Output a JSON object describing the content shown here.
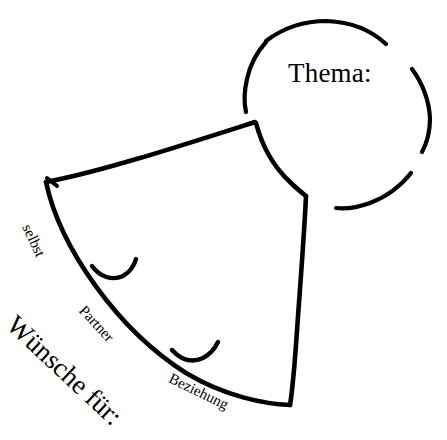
{
  "figure": {
    "kind": "hand-drawn-diagram",
    "title_visible": false,
    "background_color": "#ffffff",
    "ink_color": "#000000",
    "width": 447,
    "height": 440
  },
  "circle": {
    "name": "thema-circle",
    "label": "Thema:",
    "center": {
      "x": 337,
      "y": 109
    },
    "radius": 95,
    "style": "broken / sketched outline with four gaps",
    "arcs": [
      {
        "name": "arc-top",
        "start_deg": 205,
        "end_deg": 283
      },
      {
        "name": "arc-upper-right",
        "start_deg": 296,
        "end_deg": 345
      },
      {
        "name": "arc-lower-right",
        "start_deg": 6,
        "end_deg": 60
      },
      {
        "name": "arc-left",
        "start_deg": 118,
        "end_deg": 188
      }
    ]
  },
  "shield": {
    "name": "wuensche-shield",
    "description": "curved fan / shield shape divided into three bands",
    "vertices": {
      "top": {
        "x": 255,
        "y": 122
      },
      "left": {
        "x": 46,
        "y": 182
      },
      "bottom": {
        "x": 290,
        "y": 405
      },
      "right": {
        "x": 306,
        "y": 196
      }
    },
    "outer_label": "Wünsche für:",
    "segment_labels": [
      "selbst",
      "Partner",
      "Beziehung"
    ],
    "divider_ticks": [
      {
        "name": "tick-selbst-partner",
        "x": 95,
        "y": 272
      },
      {
        "name": "tick-partner-beziehung",
        "x": 176,
        "y": 356
      }
    ]
  },
  "labels": {
    "thema": "Thema:",
    "selbst": "selbst",
    "partner": "Partner",
    "beziehung": "Beziehung",
    "wuensche_fuer": "Wünsche für:"
  }
}
